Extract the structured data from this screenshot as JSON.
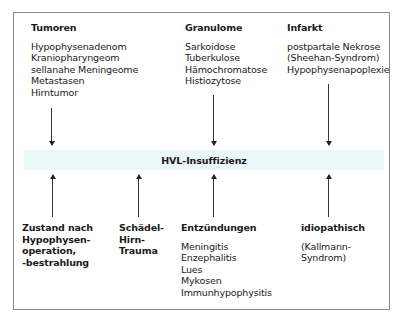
{
  "diagram": {
    "center": {
      "label": "HVL-Insuffizienz",
      "band_color": "#eaf6f9"
    },
    "top_groups": [
      {
        "title": "Tumoren",
        "items": [
          "Hypophysenadenom",
          "Kraniopharyngeom",
          "sellanahe Meningeome",
          "Metastasen",
          "Hirntumor"
        ]
      },
      {
        "title": "Granulome",
        "items": [
          "Sarkoidose",
          "Tuberkulose",
          "Hämochromatose",
          "Histiozytose"
        ]
      },
      {
        "title": "Infarkt",
        "items": [
          "postpartale Nekrose",
          "(Sheehan-Syndrom)",
          "Hypophysenapoplexie"
        ]
      }
    ],
    "bottom_groups": [
      {
        "title_lines": [
          "Zustand nach",
          "Hypophysen-",
          "operation,",
          "-bestrahlung"
        ],
        "items": []
      },
      {
        "title_lines": [
          "Schädel-",
          "Hirn-",
          "Trauma"
        ],
        "items": []
      },
      {
        "title_lines": [
          "Entzündungen"
        ],
        "items": [
          "Meningitis",
          "Enzephalitis",
          "Lues",
          "Mykosen",
          "Immunhypophysitis"
        ]
      },
      {
        "title_lines": [
          "idiopathisch"
        ],
        "items": [
          "(Kallmann-",
          "Syndrom)"
        ]
      }
    ]
  }
}
